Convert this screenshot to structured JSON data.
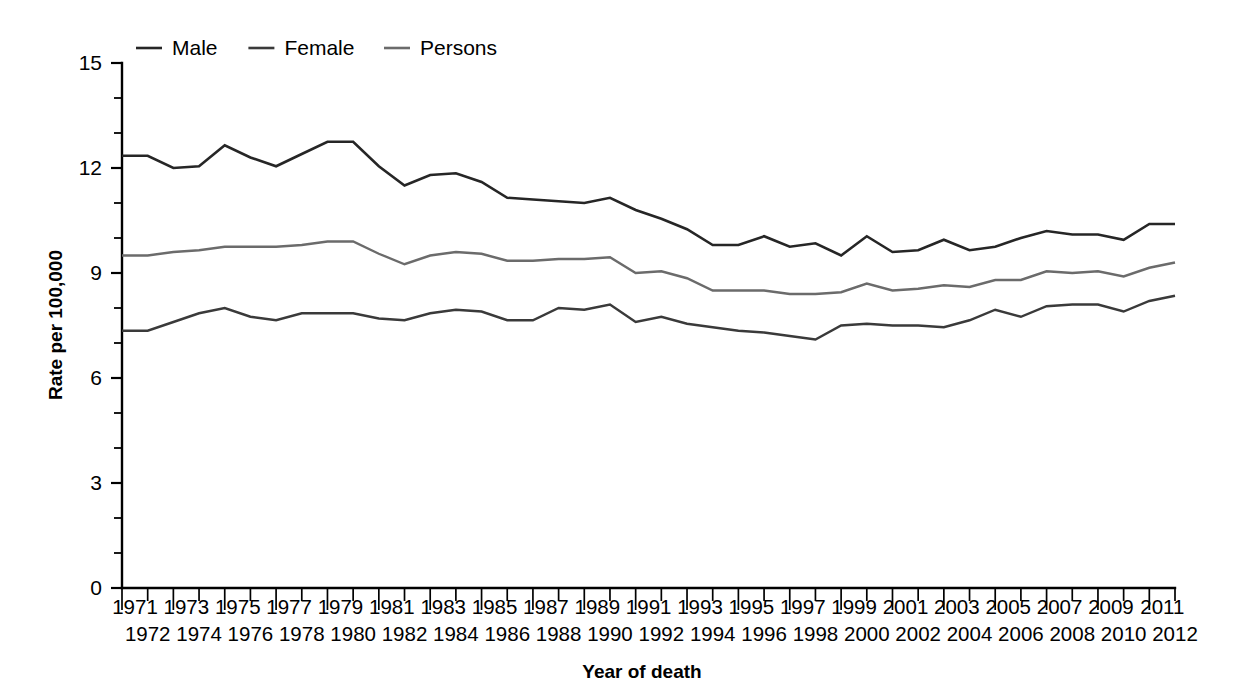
{
  "chart_data": {
    "type": "line",
    "title": "",
    "subtitle": "",
    "xlabel": "Year of death",
    "ylabel": "Rate per 100,000",
    "ylim": [
      0,
      15
    ],
    "xlim": [
      1971,
      2012
    ],
    "y_ticks": [
      0,
      3,
      6,
      9,
      12,
      15
    ],
    "y_minor_step": 1,
    "grid": false,
    "legend_position": "top-left",
    "x": [
      1971,
      1972,
      1973,
      1974,
      1975,
      1976,
      1977,
      1978,
      1979,
      1980,
      1981,
      1982,
      1983,
      1984,
      1985,
      1986,
      1987,
      1988,
      1989,
      1990,
      1991,
      1992,
      1993,
      1994,
      1995,
      1996,
      1997,
      1998,
      1999,
      2000,
      2001,
      2002,
      2003,
      2004,
      2005,
      2006,
      2007,
      2008,
      2009,
      2010,
      2011,
      2012
    ],
    "categories": [
      "1971",
      "1972",
      "1973",
      "1974",
      "1975",
      "1976",
      "1977",
      "1978",
      "1979",
      "1980",
      "1981",
      "1982",
      "1983",
      "1984",
      "1985",
      "1986",
      "1987",
      "1988",
      "1989",
      "1990",
      "1991",
      "1992",
      "1993",
      "1994",
      "1995",
      "1996",
      "1997",
      "1998",
      "1999",
      "2000",
      "2001",
      "2002",
      "2003",
      "2004",
      "2005",
      "2006",
      "2007",
      "2008",
      "2009",
      "2010",
      "2011",
      "2012"
    ],
    "x_tick_labels_top": [
      "1971",
      "",
      "1973",
      "",
      "1975",
      "",
      "1977",
      "",
      "1979",
      "",
      "1981",
      "",
      "1983",
      "",
      "1985",
      "",
      "1987",
      "",
      "1989",
      "",
      "1991",
      "",
      "1993",
      "",
      "1995",
      "",
      "1997",
      "",
      "1999",
      "",
      "2001",
      "",
      "2003",
      "",
      "2005",
      "",
      "2007",
      "",
      "2009",
      "",
      "2011",
      ""
    ],
    "x_tick_labels_bottom": [
      "",
      "1972",
      "",
      "1974",
      "",
      "1976",
      "",
      "1978",
      "",
      "1980",
      "",
      "1982",
      "",
      "1984",
      "",
      "1986",
      "",
      "1988",
      "",
      "1990",
      "",
      "1992",
      "",
      "1994",
      "",
      "1996",
      "",
      "1998",
      "",
      "2000",
      "",
      "2002",
      "",
      "2004",
      "",
      "2006",
      "",
      "2008",
      "",
      "2010",
      "",
      "2012"
    ],
    "series": [
      {
        "name": "Male",
        "color": "#262626",
        "width": 2.6,
        "values": [
          12.35,
          12.35,
          12.0,
          12.05,
          12.65,
          12.3,
          12.05,
          12.4,
          12.75,
          12.75,
          12.05,
          11.5,
          11.8,
          11.85,
          11.6,
          11.15,
          11.1,
          11.05,
          11.0,
          11.15,
          10.8,
          10.55,
          10.25,
          9.8,
          9.8,
          10.05,
          9.75,
          9.85,
          9.5,
          10.05,
          9.6,
          9.65,
          9.95,
          9.65,
          9.75,
          10.0,
          10.2,
          10.1,
          10.1,
          9.95,
          10.4,
          10.4
        ]
      },
      {
        "name": "Female",
        "color": "#3a3a3a",
        "width": 2.4,
        "values": [
          7.35,
          7.35,
          7.6,
          7.85,
          8.0,
          7.75,
          7.65,
          7.85,
          7.85,
          7.85,
          7.7,
          7.65,
          7.85,
          7.95,
          7.9,
          7.65,
          7.65,
          8.0,
          7.95,
          8.1,
          7.6,
          7.75,
          7.55,
          7.45,
          7.35,
          7.3,
          7.2,
          7.1,
          7.5,
          7.55,
          7.5,
          7.5,
          7.45,
          7.65,
          7.95,
          7.75,
          8.05,
          8.1,
          8.1,
          7.9,
          8.2,
          8.35
        ]
      },
      {
        "name": "Persons",
        "color": "#6b6b6b",
        "width": 2.4,
        "values": [
          9.5,
          9.5,
          9.6,
          9.65,
          9.75,
          9.75,
          9.75,
          9.8,
          9.9,
          9.9,
          9.55,
          9.25,
          9.5,
          9.6,
          9.55,
          9.35,
          9.35,
          9.4,
          9.4,
          9.45,
          9.0,
          9.05,
          8.85,
          8.5,
          8.5,
          8.5,
          8.4,
          8.4,
          8.45,
          8.7,
          8.5,
          8.55,
          8.65,
          8.6,
          8.8,
          8.8,
          9.05,
          9.0,
          9.05,
          8.9,
          9.15,
          9.3
        ]
      }
    ],
    "legend": [
      {
        "label": "Male",
        "color": "#262626"
      },
      {
        "label": "Female",
        "color": "#3a3a3a"
      },
      {
        "label": "Persons",
        "color": "#6b6b6b"
      }
    ]
  }
}
